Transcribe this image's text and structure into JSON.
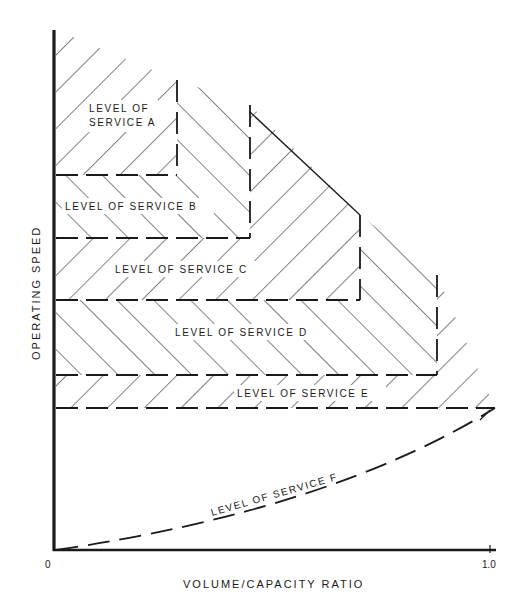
{
  "diagram": {
    "type": "level-of-service-chart",
    "x_axis": {
      "label": "VOLUME/CAPACITY RATIO",
      "ticks": [
        "0",
        "1.0"
      ]
    },
    "y_axis": {
      "label": "OPERATING SPEED"
    },
    "regions": [
      {
        "id": "A",
        "label_line1": "LEVEL OF",
        "label_line2": "SERVICE A"
      },
      {
        "id": "B",
        "label": "LEVEL OF SERVICE B"
      },
      {
        "id": "C",
        "label": "LEVEL OF SERVICE C"
      },
      {
        "id": "D",
        "label": "LEVEL OF SERVICE D"
      },
      {
        "id": "E",
        "label": "LEVEL OF SERVICE E"
      },
      {
        "id": "F",
        "label": "LEVEL OF SERVICE F"
      }
    ],
    "colors": {
      "ink": "#1a1a1a",
      "background": "#ffffff"
    }
  }
}
